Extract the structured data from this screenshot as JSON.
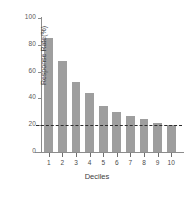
{
  "chart_data": {
    "type": "bar",
    "title": "",
    "xlabel": "Deciles",
    "ylabel": "Response Rate(%)",
    "categories": [
      "1",
      "2",
      "3",
      "4",
      "5",
      "6",
      "7",
      "8",
      "9",
      "10"
    ],
    "values": [
      85,
      68,
      52,
      44,
      34,
      30,
      27,
      25,
      22,
      20
    ],
    "ylim": [
      0,
      100
    ],
    "yticks": [
      0,
      20,
      40,
      60,
      80,
      100
    ],
    "ytick_labels": [
      "0",
      "20",
      "40",
      "60",
      "80",
      "100"
    ],
    "grid": false,
    "legend": null,
    "bar_color": "#9e9e9e",
    "axis_color": "#8c8c8c",
    "background_color": "#ffffff",
    "annotations": [
      {
        "name": "baseline-threshold",
        "type": "hline",
        "value": 20,
        "style": "dashed",
        "color": "#2b2b2b"
      }
    ]
  }
}
